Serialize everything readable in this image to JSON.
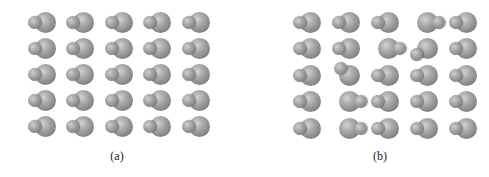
{
  "figure": {
    "panels": [
      {
        "id": "a",
        "label": "(a)",
        "description": "Ordered lattice of diatomic molecules, all aligned (small atom left, large atom right)",
        "grid": {
          "rows": 5,
          "cols": 5
        },
        "orientations": [
          [
            "right",
            "right",
            "right",
            "right",
            "right"
          ],
          [
            "right",
            "right",
            "right",
            "right",
            "right"
          ],
          [
            "right",
            "right",
            "right",
            "right",
            "right"
          ],
          [
            "right",
            "right",
            "right",
            "right",
            "right"
          ],
          [
            "right",
            "right",
            "right",
            "right",
            "right"
          ]
        ]
      },
      {
        "id": "b",
        "label": "(b)",
        "description": "Lattice of diatomic molecules with some orientational disorder",
        "grid": {
          "rows": 5,
          "cols": 5
        },
        "orientations": [
          [
            "right",
            "right",
            "right",
            "left",
            "right"
          ],
          [
            "right",
            "right",
            "left",
            "down-left",
            "right"
          ],
          [
            "right",
            "up-left",
            "right",
            "right",
            "right"
          ],
          [
            "right",
            "left",
            "right",
            "right",
            "right"
          ],
          [
            "right",
            "left",
            "right",
            "right",
            "right"
          ]
        ]
      }
    ],
    "colors": {
      "atom": "#9a9a9a",
      "background": "#ffffff",
      "label": "#222222"
    }
  }
}
